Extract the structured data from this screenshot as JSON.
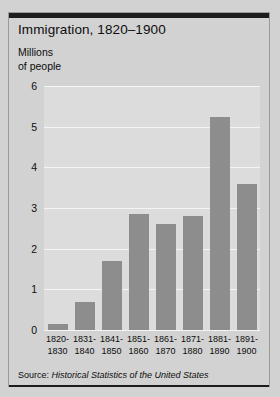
{
  "chart_data": {
    "type": "bar",
    "title": "Immigration, 1820–1900",
    "ylabel_line1": "Millions",
    "ylabel_line2": "of people",
    "xlabel": "",
    "categories": [
      "1820-\n1830",
      "1831-\n1840",
      "1841-\n1850",
      "1851-\n1860",
      "1861-\n1870",
      "1871-\n1880",
      "1881-\n1890",
      "1891-\n1900"
    ],
    "category_lines": [
      [
        "1820-",
        "1830"
      ],
      [
        "1831-",
        "1840"
      ],
      [
        "1841-",
        "1850"
      ],
      [
        "1851-",
        "1860"
      ],
      [
        "1861-",
        "1870"
      ],
      [
        "1871-",
        "1880"
      ],
      [
        "1881-",
        "1890"
      ],
      [
        "1891-",
        "1900"
      ]
    ],
    "values": [
      0.15,
      0.7,
      1.7,
      2.85,
      2.6,
      2.8,
      5.25,
      3.6
    ],
    "ylim": [
      0,
      6
    ],
    "yticks": [
      0,
      1,
      2,
      3,
      4,
      5,
      6
    ],
    "ytick_labels": [
      "0",
      "1",
      "2",
      "3",
      "4",
      "5",
      "6"
    ],
    "grid": true,
    "legend": "none",
    "bar_color": "#8d8d8d",
    "plot_background": "#dcdcdc",
    "gridline_color": "#f4f4f4",
    "figure_background": "#d2d2d2"
  },
  "source": {
    "label": "Source:",
    "title": "Historical Statistics of the United States"
  }
}
